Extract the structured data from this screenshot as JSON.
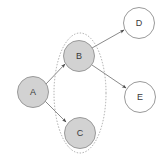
{
  "diagram": {
    "title": "",
    "background_color": "#ffffff",
    "colors": {
      "node_filled": "#d2d2d2",
      "node_empty": "#ffffff",
      "node_stroke": "#9a9a9a",
      "edge_stroke": "#8a8a8a",
      "group_stroke": "#a8a8a8",
      "label_text": "#3a3a3a",
      "arrow_fill": "#4a4a4a"
    },
    "nodes": [
      {
        "id": "A",
        "label": "A",
        "cx": 33,
        "cy": 92,
        "r": 15.5,
        "style": "filled"
      },
      {
        "id": "B",
        "label": "B",
        "cx": 79,
        "cy": 56,
        "r": 15.5,
        "style": "filled"
      },
      {
        "id": "C",
        "label": "C",
        "cx": 80,
        "cy": 133,
        "r": 15.5,
        "style": "filled"
      },
      {
        "id": "D",
        "label": "D",
        "cx": 139,
        "cy": 23,
        "r": 15.5,
        "style": "empty"
      },
      {
        "id": "E",
        "label": "E",
        "cx": 140,
        "cy": 97,
        "r": 15.5,
        "style": "empty"
      }
    ],
    "edges": [
      {
        "id": "A-B",
        "from": "A",
        "to": "B",
        "directed": true,
        "x1": 46,
        "y1": 84,
        "x2": 65,
        "y2": 64
      },
      {
        "id": "A-C",
        "from": "A",
        "to": "C",
        "directed": true,
        "x1": 45,
        "y1": 101,
        "x2": 66,
        "y2": 122
      },
      {
        "id": "B-D",
        "from": "B",
        "to": "D",
        "directed": true,
        "x1": 92,
        "y1": 48,
        "x2": 124,
        "y2": 30
      },
      {
        "id": "B-E",
        "from": "B",
        "to": "E",
        "directed": true,
        "x1": 92,
        "y1": 65,
        "x2": 126,
        "y2": 88
      }
    ],
    "groups": [
      {
        "id": "group-bc",
        "members": [
          "B",
          "C"
        ],
        "cx": 80,
        "cy": 93,
        "rx": 26,
        "ry": 60,
        "style": "dotted-ellipse"
      }
    ]
  }
}
